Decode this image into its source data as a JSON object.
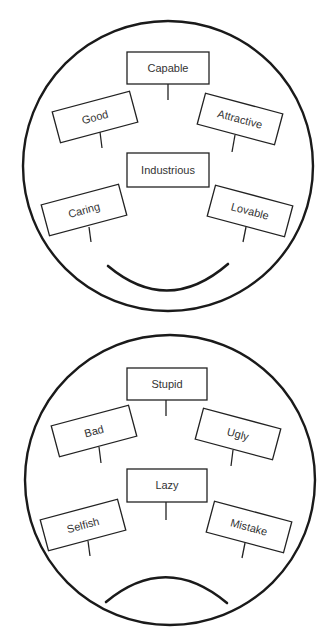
{
  "colors": {
    "background": "#ffffff",
    "stroke": "#1a1a1a",
    "text": "#333333"
  },
  "faces": [
    {
      "id": "happy-face",
      "expression": "smile",
      "labels": {
        "top_center": "Capable",
        "upper_left": "Good",
        "upper_right": "Attractive",
        "center": "Industrious",
        "lower_left": "Caring",
        "lower_right": "Lovable"
      }
    },
    {
      "id": "sad-face",
      "expression": "frown",
      "labels": {
        "top_center": "Stupid",
        "upper_left": "Bad",
        "upper_right": "Ugly",
        "center": "Lazy",
        "lower_left": "Selfish",
        "lower_right": "Mistake"
      }
    }
  ]
}
